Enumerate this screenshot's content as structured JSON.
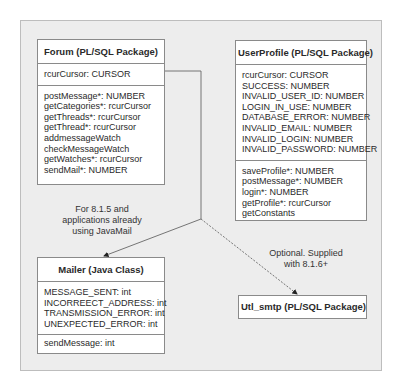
{
  "forum": {
    "title": "Forum (PL/SQL Package)",
    "attributes": [
      "rcurCursor: CURSOR"
    ],
    "operations": [
      "postMessage*: NUMBER",
      "getCategories*: rcurCursor",
      "getThreads*: rcurCursor",
      "getThread*: rcurCursor",
      "addmessageWatch",
      "checkMessageWatch",
      "getWatches*: rcurCursor",
      "sendMail*: NUMBER"
    ]
  },
  "userprofile": {
    "title": "UserProfile (PL/SQL Package)",
    "attributes": [
      "rcurCursor: CURSOR",
      "SUCCESS: NUMBER",
      "INVALID_USER_ID: NUMBER",
      "LOGIN_IN_USE: NUMBER",
      "DATABASE_ERROR: NUMBER",
      "INVALID_EMAIL: NUMBER",
      "INVALID_LOGIN: NUMBER",
      "INVALID_PASSWORD: NUMBER"
    ],
    "operations": [
      "saveProfile*: NUMBER",
      "postMessage*: NUMBER",
      "login*: NUMBER",
      "getProfile*: rcurCursor",
      "getConstants"
    ]
  },
  "mailer": {
    "title": "Mailer (Java Class)",
    "attributes": [
      "MESSAGE_SENT: int",
      "INCORREECT_ADDRESS: int",
      "TRANSMISSION_ERROR: int",
      "UNEXPECTED_ERROR: int"
    ],
    "operations": [
      "sendMessage: int"
    ]
  },
  "utl_smtp": {
    "title": "Utl_smtp (PL/SQL Package)"
  },
  "notes": {
    "mailer_note": [
      "For 8.1.5 and",
      "applications already",
      "using JavaMail"
    ],
    "utl_note": [
      "Optional. Supplied",
      "with 8.1.6+"
    ]
  },
  "colors": {
    "panel_bg": "#ededed",
    "box_border": "#8a8a8a",
    "connector": "#666666"
  }
}
